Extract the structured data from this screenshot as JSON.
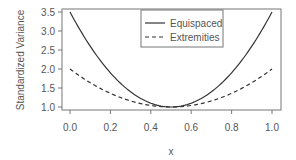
{
  "chart_data": {
    "type": "line",
    "title": "",
    "xlabel": "x",
    "ylabel": "Standardized Variance",
    "xlim": [
      0.0,
      1.0
    ],
    "ylim": [
      1.0,
      3.5
    ],
    "x_ticks": [
      "0.0",
      "0.2",
      "0.4",
      "0.6",
      "0.8",
      "1.0"
    ],
    "y_ticks": [
      "1.0",
      "1.5",
      "2.0",
      "2.5",
      "3.0",
      "3.5"
    ],
    "grid": false,
    "legend_position": "top-center",
    "x": [
      0.0,
      0.1,
      0.2,
      0.3,
      0.4,
      0.5,
      0.6,
      0.7,
      0.8,
      0.9,
      1.0
    ],
    "series": [
      {
        "name": "Equispaced",
        "line_style": "solid",
        "values": [
          3.5,
          2.6,
          1.9,
          1.4,
          1.1,
          1.0,
          1.1,
          1.4,
          1.9,
          2.6,
          3.5
        ]
      },
      {
        "name": "Extremities",
        "line_style": "dashed",
        "values": [
          2.0,
          1.64,
          1.36,
          1.16,
          1.04,
          1.0,
          1.04,
          1.16,
          1.36,
          1.64,
          2.0
        ]
      }
    ]
  },
  "legend": {
    "items": [
      {
        "label": "Equispaced"
      },
      {
        "label": "Extremities"
      }
    ]
  },
  "colors": {
    "line": "#333333",
    "axis": "#555555"
  }
}
